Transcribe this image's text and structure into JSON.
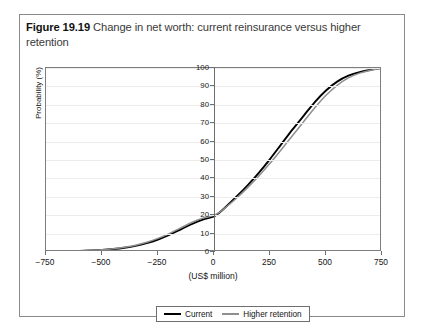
{
  "figure": {
    "number": "Figure 19.19",
    "caption": "Change in net worth: current reinsurance versus higher retention"
  },
  "chart_data": {
    "type": "line",
    "title": "Change in net worth: current reinsurance versus higher retention",
    "xlabel": "(US$ million)",
    "ylabel": "Probability (%)",
    "xlim": [
      -750,
      750
    ],
    "ylim": [
      0,
      100
    ],
    "xticks": [
      -750,
      -500,
      -250,
      0,
      250,
      500,
      750
    ],
    "xtick_labels": [
      "−750",
      "−500",
      "−250",
      "0",
      "250",
      "500",
      "750"
    ],
    "yticks": [
      0,
      10,
      20,
      30,
      40,
      50,
      60,
      70,
      80,
      90,
      100
    ],
    "ytick_labels": [
      "0",
      "10",
      "20",
      "30",
      "40",
      "50",
      "60",
      "70",
      "80",
      "90",
      "100"
    ],
    "grid": "horizontal",
    "legend_position": "below-axes",
    "x": [
      -750,
      -700,
      -650,
      -600,
      -550,
      -500,
      -450,
      -400,
      -350,
      -300,
      -250,
      -200,
      -150,
      -100,
      -50,
      0,
      25,
      50,
      100,
      150,
      200,
      250,
      300,
      350,
      400,
      450,
      500,
      550,
      600,
      650,
      700,
      750
    ],
    "series": [
      {
        "name": "Current",
        "color": "#000000",
        "values": [
          0.2,
          0.3,
          0.4,
          0.6,
          0.8,
          1.1,
          1.6,
          2.3,
          3.3,
          4.8,
          6.8,
          9.3,
          12.2,
          15.2,
          17.6,
          19.3,
          21.5,
          24.2,
          30.0,
          36.2,
          43.0,
          50.5,
          58.5,
          66.5,
          74.0,
          81.5,
          87.8,
          92.6,
          95.8,
          97.8,
          99.0,
          100.0
        ]
      },
      {
        "name": "Higher retention",
        "color": "#8f8f8f",
        "values": [
          0.2,
          0.3,
          0.4,
          0.6,
          0.9,
          1.2,
          1.8,
          2.6,
          3.7,
          5.3,
          7.4,
          10.0,
          13.0,
          16.0,
          18.4,
          19.9,
          21.6,
          24.0,
          29.2,
          35.0,
          41.3,
          48.2,
          55.6,
          63.2,
          70.8,
          78.4,
          85.2,
          90.6,
          94.6,
          97.2,
          98.8,
          100.0
        ]
      }
    ],
    "legend": [
      {
        "label": "Current",
        "color": "#000000"
      },
      {
        "label": "Higher retention",
        "color": "#8f8f8f"
      }
    ]
  }
}
